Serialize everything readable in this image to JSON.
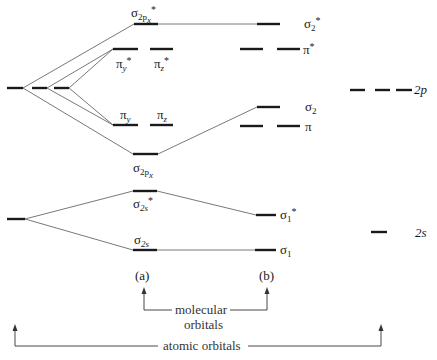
{
  "diagram": {
    "title": "",
    "type": "molecular orbital energy-level diagram",
    "atomic_orbitals_left": [
      {
        "id": "2p-left",
        "label": "",
        "degeneracy": 3
      },
      {
        "id": "2s-left",
        "label": "",
        "degeneracy": 1
      }
    ],
    "column_a": {
      "label": "(a)",
      "levels": [
        {
          "id": "sigma2px-star",
          "symbol": "σ",
          "sub": "2p",
          "subsub": "x",
          "star": "*"
        },
        {
          "id": "pi-y-star",
          "symbol": "π",
          "sub": "y",
          "star": "*"
        },
        {
          "id": "pi-z-star",
          "symbol": "π",
          "sub": "z",
          "star": "*"
        },
        {
          "id": "pi-y",
          "symbol": "π",
          "sub": "y",
          "star": ""
        },
        {
          "id": "pi-z",
          "symbol": "π",
          "sub": "z",
          "star": ""
        },
        {
          "id": "sigma2px",
          "symbol": "σ",
          "sub": "2p",
          "subsub": "x",
          "star": ""
        },
        {
          "id": "sigma2s-star",
          "symbol": "σ",
          "sub": "2s",
          "star": "*"
        },
        {
          "id": "sigma2s",
          "symbol": "σ",
          "sub": "2s",
          "star": ""
        }
      ]
    },
    "column_b": {
      "label": "(b)",
      "levels": [
        {
          "id": "sigma2-star",
          "symbol": "σ",
          "sub": "2",
          "star": "*"
        },
        {
          "id": "pi-star",
          "symbol": "π",
          "sub": "",
          "star": "*"
        },
        {
          "id": "sigma2",
          "symbol": "σ",
          "sub": "2",
          "star": ""
        },
        {
          "id": "pi",
          "symbol": "π",
          "sub": "",
          "star": ""
        },
        {
          "id": "sigma1-star",
          "symbol": "σ",
          "sub": "1",
          "star": "*"
        },
        {
          "id": "sigma1",
          "symbol": "σ",
          "sub": "1",
          "star": ""
        }
      ]
    },
    "atomic_orbitals_right": [
      {
        "id": "2p-right",
        "label": "2p",
        "degeneracy": 3
      },
      {
        "id": "2s-right",
        "label": "2s",
        "degeneracy": 1
      }
    ],
    "brackets": {
      "molecular": {
        "line1": "molecular",
        "line2": "orbitals"
      },
      "atomic": {
        "label": "atomic orbitals"
      }
    }
  },
  "labels": {
    "s": "σ",
    "p": "π",
    "star": "*",
    "sub_2p": "2p",
    "sub_x": "x",
    "sub_y": "y",
    "sub_z": "z",
    "sub_2s": "2s",
    "sub_2": "2",
    "sub_1": "1",
    "col_a": "(a)",
    "col_b": "(b)",
    "ao_2p": "2p",
    "ao_2s": "2s",
    "mo_line1": "molecular",
    "mo_line2": "orbitals",
    "ao_bracket": "atomic orbitals"
  }
}
